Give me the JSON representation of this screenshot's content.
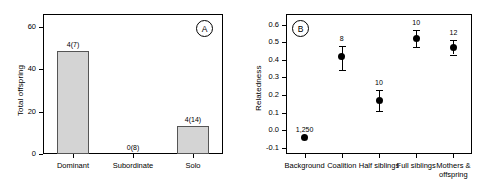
{
  "figure": {
    "background_color": "#ffffff",
    "axis_color": "#000000",
    "bar_fill_color": "#d4d4d4",
    "bar_edge_color": "#555555",
    "point_color": "#000000"
  },
  "chart_data": [
    {
      "type": "bar",
      "panel": "A",
      "panel_tag": "A",
      "title": "",
      "xlabel": "",
      "ylabel": "Total offspring",
      "categories": [
        "Dominant",
        "Subordinate",
        "Solo"
      ],
      "values": [
        48.5,
        0,
        13.3
      ],
      "point_labels": [
        "4(7)",
        "0(8)",
        "4(14)"
      ],
      "yticks": [
        0,
        20,
        40,
        60
      ],
      "ytick_labels": [
        "0",
        "20",
        "40",
        "60"
      ],
      "ylim": [
        0,
        66
      ],
      "grid": false,
      "legend": "none"
    },
    {
      "type": "scatter",
      "panel": "B",
      "panel_tag": "B",
      "title": "",
      "xlabel": "",
      "ylabel": "Relatedness",
      "categories": [
        "Background",
        "Coalition",
        "Half siblings",
        "Full siblings",
        "Mothers & offspring"
      ],
      "values": [
        -0.04,
        0.42,
        0.17,
        0.52,
        0.47
      ],
      "err_low": [
        -0.04,
        0.34,
        0.11,
        0.47,
        0.43
      ],
      "err_high": [
        -0.04,
        0.48,
        0.23,
        0.57,
        0.51
      ],
      "point_labels": [
        "1,250",
        "8",
        "10",
        "10",
        "12"
      ],
      "yticks": [
        -0.1,
        0.0,
        0.1,
        0.2,
        0.3,
        0.4,
        0.5,
        0.6
      ],
      "ytick_labels": [
        "-0.1",
        "0.0",
        "0.1",
        "0.2",
        "0.3",
        "0.4",
        "0.5",
        "0.6"
      ],
      "ylim": [
        -0.135,
        0.66
      ],
      "grid": false,
      "legend": "none"
    }
  ]
}
